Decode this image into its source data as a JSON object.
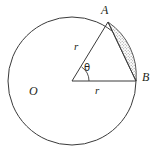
{
  "figure": {
    "background_color": "#ffffff",
    "stroke_color": "#231f20",
    "shade_color": "#b3b3b3"
  },
  "labels": {
    "point_a": "A",
    "point_b": "B",
    "center_o": "O",
    "radius_oa": "r",
    "radius_ob": "r",
    "angle": "θ"
  },
  "geometry": {
    "circle": {
      "cx": 72,
      "cy": 81,
      "r": 64
    },
    "center_point": {
      "x": 72,
      "y": 81,
      "name": "O"
    },
    "point_a": {
      "x": 108,
      "y": 22
    },
    "point_b": {
      "x": 136,
      "y": 81
    },
    "angle_arc_radius": 17,
    "angle_degrees": 58,
    "shaded_region": "circular segment between chord AB and minor arc AB"
  },
  "icons": {
    "circle_outline": "circle-outline-icon",
    "radius_line": "radius-line-icon",
    "chord_line": "chord-line-icon",
    "angle_arc": "angle-arc-icon",
    "segment_fill": "segment-shade-icon"
  }
}
